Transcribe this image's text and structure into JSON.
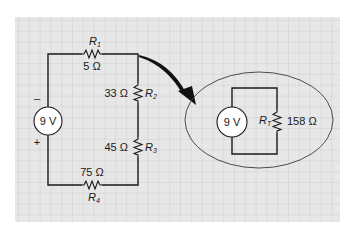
{
  "colors": {
    "paper_background": "#e7e7e7",
    "grid_line": "#c4c4c4",
    "ink": "#1a1a1a",
    "page_background": "#ffffff"
  },
  "original_circuit": {
    "source": {
      "label": "9 V",
      "minus_sign": "–",
      "plus_sign": "+"
    },
    "resistors": [
      {
        "name": "R",
        "subscript": "1",
        "value": "5 Ω",
        "position": "top"
      },
      {
        "name": "R",
        "subscript": "2",
        "value": "33 Ω",
        "position": "right-upper"
      },
      {
        "name": "R",
        "subscript": "3",
        "value": "45 Ω",
        "position": "right-lower"
      },
      {
        "name": "R",
        "subscript": "4",
        "value": "75 Ω",
        "position": "bottom"
      }
    ]
  },
  "equivalent_circuit": {
    "source": {
      "label": "9 V"
    },
    "resistor": {
      "name": "R",
      "subscript": "T",
      "value": "158 Ω"
    }
  },
  "icons": {
    "arrow": "curved-arrow-icon",
    "resistor": "zigzag-resistor-icon",
    "source": "voltage-source-circle-icon"
  }
}
